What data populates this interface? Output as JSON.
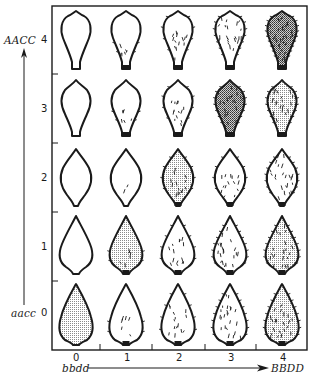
{
  "figure": {
    "y_axis": {
      "top_label": "AACC",
      "bottom_label": "aacc",
      "ticks": [
        "4",
        "3",
        "2",
        "1",
        "0"
      ]
    },
    "x_axis": {
      "left_label": "bbdd",
      "right_label": "BBDD",
      "ticks": [
        "0",
        "1",
        "2",
        "3",
        "4"
      ]
    },
    "grid": {
      "rows": [
        {
          "y_value": "4",
          "shape": "obovate-long",
          "cells": [
            {
              "x_value": "0",
              "shading": "none",
              "hairs": "none"
            },
            {
              "x_value": "1",
              "shading": "none",
              "hairs": "few"
            },
            {
              "x_value": "2",
              "shading": "none",
              "hairs": "some"
            },
            {
              "x_value": "3",
              "shading": "none",
              "hairs": "many"
            },
            {
              "x_value": "4",
              "shading": "dark",
              "hairs": "dense"
            }
          ]
        },
        {
          "y_value": "3",
          "shape": "obovate",
          "cells": [
            {
              "x_value": "0",
              "shading": "none",
              "hairs": "none"
            },
            {
              "x_value": "1",
              "shading": "none",
              "hairs": "few"
            },
            {
              "x_value": "2",
              "shading": "none",
              "hairs": "some"
            },
            {
              "x_value": "3",
              "shading": "dark",
              "hairs": "many"
            },
            {
              "x_value": "4",
              "shading": "light",
              "hairs": "many"
            }
          ]
        },
        {
          "y_value": "2",
          "shape": "elliptic",
          "cells": [
            {
              "x_value": "0",
              "shading": "none",
              "hairs": "none"
            },
            {
              "x_value": "1",
              "shading": "none",
              "hairs": "trace"
            },
            {
              "x_value": "2",
              "shading": "light",
              "hairs": "some"
            },
            {
              "x_value": "3",
              "shading": "none",
              "hairs": "some"
            },
            {
              "x_value": "4",
              "shading": "none",
              "hairs": "many"
            }
          ]
        },
        {
          "y_value": "1",
          "shape": "ovate",
          "cells": [
            {
              "x_value": "0",
              "shading": "none",
              "hairs": "none"
            },
            {
              "x_value": "1",
              "shading": "light",
              "hairs": "few"
            },
            {
              "x_value": "2",
              "shading": "none",
              "hairs": "some"
            },
            {
              "x_value": "3",
              "shading": "none",
              "hairs": "many"
            },
            {
              "x_value": "4",
              "shading": "light",
              "hairs": "many"
            }
          ]
        },
        {
          "y_value": "0",
          "shape": "ovate-broad",
          "cells": [
            {
              "x_value": "0",
              "shading": "light",
              "hairs": "none"
            },
            {
              "x_value": "1",
              "shading": "none",
              "hairs": "few"
            },
            {
              "x_value": "2",
              "shading": "none",
              "hairs": "some"
            },
            {
              "x_value": "3",
              "shading": "none",
              "hairs": "many"
            },
            {
              "x_value": "4",
              "shading": "light",
              "hairs": "many"
            }
          ]
        }
      ]
    },
    "colors": {
      "ink": "#1a1a1a",
      "background": "#ffffff",
      "stipple_light": "#bdbdbd",
      "stipple_dark": "#7a7a7a"
    }
  }
}
